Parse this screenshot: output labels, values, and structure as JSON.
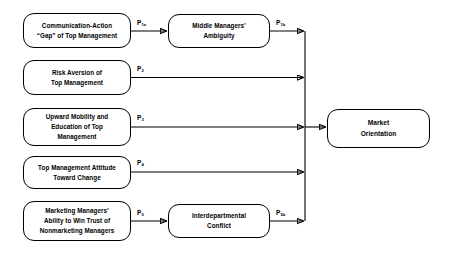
{
  "diagram": {
    "type": "flow-diagram",
    "title": "",
    "background_color": "#ffffff",
    "line_color": "#000000",
    "nodes": [
      {
        "id": "communication-action-gap",
        "label": "Communication-Action\n“Gap” of Top Management",
        "column": "antecedent",
        "row": 1
      },
      {
        "id": "risk-aversion",
        "label": "Risk Aversion of\nTop Management",
        "column": "antecedent",
        "row": 2
      },
      {
        "id": "upward-mobility-education",
        "label": "Upward Mobility and\nEducation of Top\nManagement",
        "column": "antecedent",
        "row": 3
      },
      {
        "id": "top-management-attitude",
        "label": "Top Management Attitude\nToward Change",
        "column": "antecedent",
        "row": 4
      },
      {
        "id": "marketing-managers-ability",
        "label": "Marketing Managers’\nAbility to Win Trust of\nNonmarketing Managers",
        "column": "antecedent",
        "row": 5
      },
      {
        "id": "middle-managers-ambiguity",
        "label": "Middle Managers’\nAmbiguity",
        "column": "mediator",
        "row": 1
      },
      {
        "id": "interdepartmental-conflict",
        "label": "Interdepartmental\nConflict",
        "column": "mediator",
        "row": 5
      },
      {
        "id": "market-orientation",
        "label": "Market\nOrientation",
        "column": "outcome",
        "row": 3
      }
    ],
    "path_labels": [
      {
        "id": "p1a",
        "base": "P",
        "sub": "1a",
        "from": "communication-action-gap",
        "to": "middle-managers-ambiguity"
      },
      {
        "id": "p1b",
        "base": "P",
        "sub": "1b",
        "from": "middle-managers-ambiguity",
        "to": "market-orientation"
      },
      {
        "id": "p2",
        "base": "P",
        "sub": "2",
        "from": "risk-aversion",
        "to": "market-orientation"
      },
      {
        "id": "p3",
        "base": "P",
        "sub": "3",
        "from": "upward-mobility-education",
        "to": "market-orientation"
      },
      {
        "id": "p4",
        "base": "P",
        "sub": "4",
        "from": "top-management-attitude",
        "to": "market-orientation"
      },
      {
        "id": "p5",
        "base": "P",
        "sub": "5",
        "from": "marketing-managers-ability",
        "to": "interdepartmental-conflict"
      },
      {
        "id": "p5b",
        "base": "P",
        "sub": "5b",
        "from": "interdepartmental-conflict",
        "to": "market-orientation"
      }
    ]
  }
}
